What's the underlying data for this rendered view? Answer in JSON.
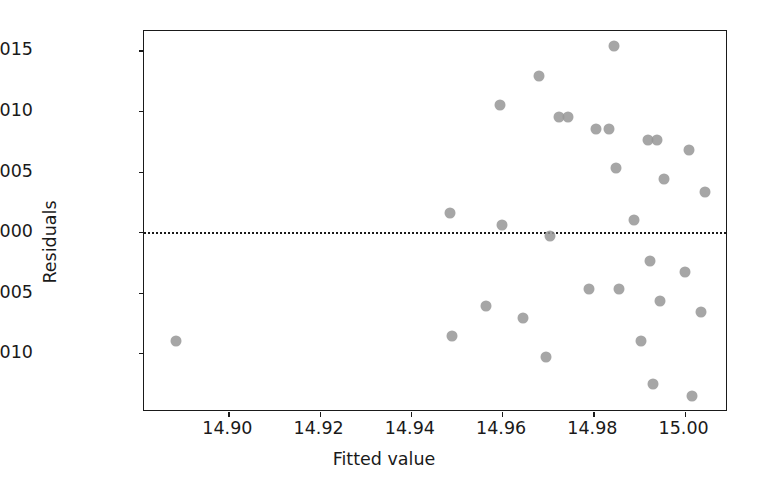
{
  "chart_data": {
    "type": "scatter",
    "title": "",
    "xlabel": "Fitted value",
    "ylabel": "Residuals",
    "xlim": [
      14.8815,
      15.0095
    ],
    "ylim": [
      -0.01485,
      0.0166
    ],
    "xticks": [
      14.9,
      14.92,
      14.94,
      14.96,
      14.98,
      15.0
    ],
    "xticklabels": [
      "14.90",
      "14.92",
      "14.94",
      "14.96",
      "14.98",
      "15.00"
    ],
    "yticks": [
      0.015,
      0.01,
      0.005,
      0.0,
      -0.005,
      -0.01
    ],
    "yticklabels": [
      "0.015",
      "0.010",
      "0.005",
      "0.000",
      "−0.005",
      "−0.010"
    ],
    "grid": false,
    "legend": null,
    "marker_color": "#969696",
    "marker_size": 11,
    "marker_alpha": 0.85,
    "reference_line": {
      "y": 0.0,
      "style": "dotted",
      "color": "#1a1a1a",
      "width": 2.2
    },
    "n_points": 31,
    "points": [
      {
        "x": 14.8885,
        "y": -0.009
      },
      {
        "x": 14.9485,
        "y": 0.0016
      },
      {
        "x": 14.949,
        "y": -0.0086
      },
      {
        "x": 14.9565,
        "y": -0.0061
      },
      {
        "x": 14.9595,
        "y": 0.0105
      },
      {
        "x": 14.96,
        "y": 0.0006
      },
      {
        "x": 14.9645,
        "y": -0.0071
      },
      {
        "x": 14.968,
        "y": 0.0129
      },
      {
        "x": 14.9695,
        "y": -0.0103
      },
      {
        "x": 14.9705,
        "y": -0.0003
      },
      {
        "x": 14.9725,
        "y": 0.0095
      },
      {
        "x": 14.979,
        "y": -0.0047
      },
      {
        "x": 14.9805,
        "y": 0.0085
      },
      {
        "x": 14.9845,
        "y": 0.0154
      },
      {
        "x": 14.985,
        "y": 0.0053
      },
      {
        "x": 14.9855,
        "y": -0.0047
      },
      {
        "x": 14.989,
        "y": 0.001
      },
      {
        "x": 14.9905,
        "y": -0.009
      },
      {
        "x": 14.992,
        "y": 0.0076
      },
      {
        "x": 14.9925,
        "y": -0.0024
      },
      {
        "x": 14.993,
        "y": -0.0125
      },
      {
        "x": 14.9945,
        "y": -0.0057
      },
      {
        "x": 14.9955,
        "y": 0.0044
      },
      {
        "x": 15.0,
        "y": -0.0033
      },
      {
        "x": 15.001,
        "y": 0.0068
      },
      {
        "x": 15.0015,
        "y": -0.0135
      },
      {
        "x": 15.0035,
        "y": -0.0066
      },
      {
        "x": 15.0045,
        "y": 0.0033
      },
      {
        "x": 14.9835,
        "y": 0.0085
      },
      {
        "x": 14.9745,
        "y": 0.0095
      },
      {
        "x": 14.994,
        "y": 0.0076
      }
    ]
  }
}
